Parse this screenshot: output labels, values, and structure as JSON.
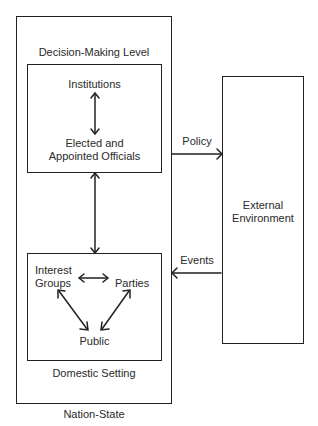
{
  "diagram": {
    "outer_box_label": "Nation-State",
    "decision_level": {
      "title": "Decision-Making Level",
      "nodes": [
        "Institutions",
        "Elected and",
        "Appointed Officials"
      ]
    },
    "domestic": {
      "title": "Domestic Setting",
      "nodes": {
        "interest1": "Interest",
        "interest2": "Groups",
        "parties": "Parties",
        "public": "Public"
      }
    },
    "external": {
      "line1": "External",
      "line2": "Environment"
    },
    "flows": {
      "policy": "Policy",
      "events": "Events"
    }
  }
}
